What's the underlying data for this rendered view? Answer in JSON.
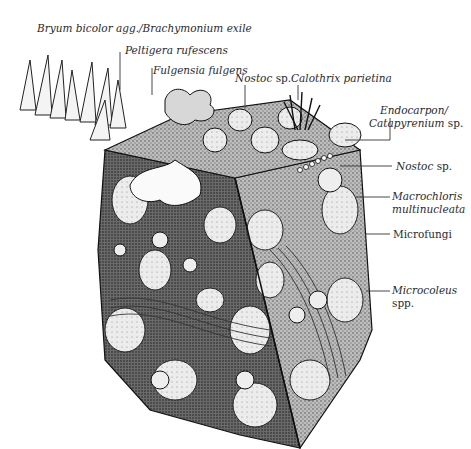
{
  "figure": {
    "labels": [
      {
        "id": "bryum",
        "parts": [
          {
            "text": "Bryum bicolor agg./Brachymonium exile",
            "italic": true
          }
        ]
      },
      {
        "id": "peltigera",
        "parts": [
          {
            "text": "Peltigera rufescens",
            "italic": true
          }
        ]
      },
      {
        "id": "fulgensia",
        "parts": [
          {
            "text": "Fulgensia fulgens",
            "italic": true
          }
        ]
      },
      {
        "id": "nostoc_top",
        "parts": [
          {
            "text": "Nostoc",
            "italic": true
          },
          {
            "text": " sp.",
            "italic": false
          }
        ]
      },
      {
        "id": "calothrix",
        "parts": [
          {
            "text": "Calothrix parietina",
            "italic": true
          }
        ]
      },
      {
        "id": "endocarpon_1",
        "parts": [
          {
            "text": "Endocarpon/",
            "italic": true
          }
        ]
      },
      {
        "id": "endocarpon_2",
        "parts": [
          {
            "text": "Catapyrenium",
            "italic": true
          },
          {
            "text": " sp.",
            "italic": false
          }
        ]
      },
      {
        "id": "nostoc_right",
        "parts": [
          {
            "text": "Nostoc",
            "italic": true
          },
          {
            "text": " sp.",
            "italic": false
          }
        ]
      },
      {
        "id": "macrochloris_1",
        "parts": [
          {
            "text": "Macrochloris",
            "italic": true
          }
        ]
      },
      {
        "id": "macrochloris_2",
        "parts": [
          {
            "text": "multinucleata",
            "italic": true
          }
        ]
      },
      {
        "id": "microfungi",
        "parts": [
          {
            "text": "Microfungi",
            "italic": false
          }
        ]
      },
      {
        "id": "microcoleus_1",
        "parts": [
          {
            "text": "Microcoleus",
            "italic": true
          }
        ]
      },
      {
        "id": "microcoleus_2",
        "parts": [
          {
            "text": "spp.",
            "italic": false
          }
        ]
      }
    ]
  }
}
